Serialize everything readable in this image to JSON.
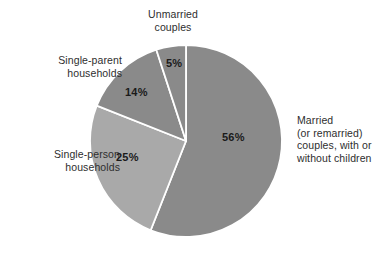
{
  "chart_data": {
    "type": "pie",
    "title": "",
    "subtitle": "",
    "xlabel": "",
    "ylabel": "",
    "legend_position": "none",
    "grid": false,
    "units": "percent",
    "total": 100,
    "start_angle_deg": 0,
    "direction": "clockwise",
    "categories": [
      "Married (or remarried) couples, with or without children",
      "Single-person households",
      "Single-parent households",
      "Unmarried couples"
    ],
    "values": [
      56,
      25,
      14,
      5
    ],
    "slices": [
      {
        "key": "married",
        "label": "Married\n(or remarried)\ncouples, with or\nwithout children",
        "value": 56,
        "value_text": "56%",
        "color": "#8a8a8a",
        "label_side": "right"
      },
      {
        "key": "single-person",
        "label": "Single-person\nhouseholds",
        "value": 25,
        "value_text": "25%",
        "color": "#a9a9a9",
        "label_side": "left"
      },
      {
        "key": "single-parent",
        "label": "Single-parent\nhouseholds",
        "value": 14,
        "value_text": "14%",
        "color": "#8a8a8a",
        "label_side": "left"
      },
      {
        "key": "unmarried",
        "label": "Unmarried\ncouples",
        "value": 5,
        "value_text": "5%",
        "color": "#8a8a8a",
        "label_side": "top"
      }
    ],
    "colors": {
      "background": "#ffffff",
      "slice_dark": "#8a8a8a",
      "slice_light": "#a9a9a9",
      "divider": "#ffffff",
      "label_text": "#2e2e2e",
      "value_text": "#1a1a1a"
    }
  },
  "labels": {
    "unmarried": "Unmarried\ncouples",
    "single_parent": "Single-parent\nhouseholds",
    "single_person": "Single-person\nhouseholds",
    "married": "Married\n(or remarried)\ncouples, with or\nwithout children"
  },
  "values": {
    "married": "56%",
    "single_person": "25%",
    "single_parent": "14%",
    "unmarried": "5%"
  }
}
